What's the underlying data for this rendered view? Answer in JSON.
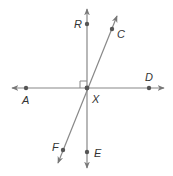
{
  "diagram": {
    "type": "geometry-lines",
    "center": {
      "label": "X",
      "x": 87,
      "y": 88
    },
    "points": [
      {
        "label": "R",
        "x": 87,
        "y": 24
      },
      {
        "label": "C",
        "x": 112,
        "y": 29
      },
      {
        "label": "D",
        "x": 149,
        "y": 88
      },
      {
        "label": "A",
        "x": 26,
        "y": 88
      },
      {
        "label": "X",
        "x": 87,
        "y": 88
      },
      {
        "label": "F",
        "x": 63,
        "y": 150
      },
      {
        "label": "E",
        "x": 87,
        "y": 152
      }
    ],
    "lines": [
      {
        "name": "AD",
        "through": [
          "A",
          "X",
          "D"
        ],
        "orientation": "horizontal"
      },
      {
        "name": "RE",
        "through": [
          "R",
          "X",
          "E"
        ],
        "orientation": "vertical"
      },
      {
        "name": "CF",
        "through": [
          "C",
          "X",
          "F"
        ],
        "orientation": "oblique"
      }
    ],
    "right_angle": {
      "at": "X",
      "between": [
        "XR",
        "XA"
      ]
    },
    "labels": {
      "R": "R",
      "C": "C",
      "D": "D",
      "A": "A",
      "X": "X",
      "F": "F",
      "E": "E"
    },
    "colors": {
      "line": "#777777",
      "point": "#555555",
      "text": "#333333"
    }
  }
}
